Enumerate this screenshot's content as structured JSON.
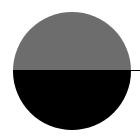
{
  "figure": {
    "shape": "half-filled-circle",
    "colors": {
      "background": "#ffffff",
      "top_half": "#6d6d6d",
      "bottom_half": "#000000",
      "divider_line": "#000000"
    }
  }
}
